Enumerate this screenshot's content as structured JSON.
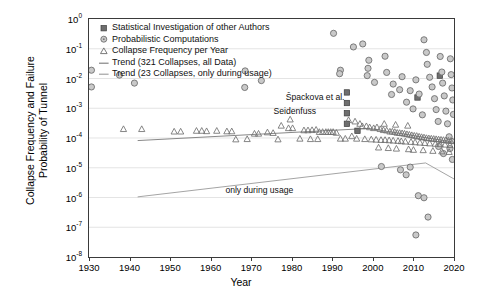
{
  "chart_data": {
    "type": "scatter",
    "title": "",
    "xlabel": "Year",
    "ylabel": "Collapse Frequency and Failure Probability of Tunnel",
    "ylabel_line1": "Collapse Frequency and Failure",
    "ylabel_line2": "Probability of Tunnel",
    "xlim": [
      1930,
      2020
    ],
    "ylim": [
      1e-08,
      1
    ],
    "yscale": "log",
    "xticks": [
      1930,
      1940,
      1950,
      1960,
      1970,
      1980,
      1990,
      2000,
      2010,
      2020
    ],
    "xtick_labels": [
      "1930",
      "1940",
      "1950",
      "1960",
      "1970",
      "1980",
      "1990",
      "2000",
      "2010",
      "2020"
    ],
    "yticks": [
      1,
      0.1,
      0.01,
      0.001,
      0.0001,
      1e-05,
      1e-06,
      1e-07,
      1e-08
    ],
    "ytick_labels": [
      "10⁰",
      "10⁻¹",
      "10⁻²",
      "10⁻³",
      "10⁻⁴",
      "10⁻⁵",
      "10⁻⁶",
      "10⁻⁷",
      "10⁻⁸"
    ],
    "ytick_mantissa": [
      "10",
      "10",
      "10",
      "10",
      "10",
      "10",
      "10",
      "10",
      "10"
    ],
    "ytick_exponents": [
      "0",
      "-1",
      "-2",
      "-3",
      "-4",
      "-5",
      "-6",
      "-7",
      "-8"
    ],
    "grid": true,
    "grid_color": "#d8d8d8",
    "legend_position": "upper-left",
    "legend": [
      {
        "label": "Statistical Investigation of other Authors",
        "marker": "square",
        "color": "#8c8c8c"
      },
      {
        "label": "Probabilistic Computations",
        "marker": "circle",
        "color": "#8c8c8c"
      },
      {
        "label": "Collapse Frequency per Year",
        "marker": "triangle",
        "color": "#6b6b6b"
      },
      {
        "label": "Trend (321 Collapses, all Data)",
        "marker": "line",
        "color": "#7a7a7a"
      },
      {
        "label": "Trend (23 Collapses, only during usage)",
        "marker": "line",
        "color": "#9a9a9a"
      }
    ],
    "annotations": [
      {
        "text": "Špackova et al.",
        "x": 1993.0,
        "y": 0.0022,
        "align": "right"
      },
      {
        "text": "Seidenfuss",
        "x": 1986.0,
        "y": 0.00075,
        "align": "right"
      },
      {
        "text": "only during usage",
        "x": 1972.0,
        "y": 1.6e-06,
        "align": "center"
      }
    ],
    "series": [
      {
        "name": "Statistical Investigation of other Authors",
        "marker": "square",
        "color": "#6e6e6e",
        "points": [
          [
            1993.6,
            0.0034
          ],
          [
            1993.6,
            0.0015
          ],
          [
            1993.6,
            0.00068
          ],
          [
            1993.6,
            0.0003
          ],
          [
            1996.2,
            0.000175
          ],
          [
            2011.0,
            0.0023
          ],
          [
            2016.5,
            0.0125
          ]
        ]
      },
      {
        "name": "Probabilistic Computations",
        "marker": "circle",
        "color": "#9a9a9a",
        "points": [
          [
            1930.6,
            0.019
          ],
          [
            1930.6,
            0.0052
          ],
          [
            1937.5,
            0.013
          ],
          [
            1941.2,
            0.007
          ],
          [
            1968.5,
            0.018
          ],
          [
            1972.5,
            0.0085
          ],
          [
            1968.4,
            0.005
          ],
          [
            1990.3,
            0.33
          ],
          [
            1995.2,
            0.115
          ],
          [
            1992.0,
            0.019
          ],
          [
            1991.8,
            0.0145
          ],
          [
            1997.5,
            0.145
          ],
          [
            1999.0,
            0.041
          ],
          [
            1998.8,
            0.022
          ],
          [
            1998.6,
            0.0125
          ],
          [
            2000.4,
            0.0074
          ],
          [
            2003.0,
            0.056
          ],
          [
            2003.4,
            0.016
          ],
          [
            2005.0,
            0.0065
          ],
          [
            2004.6,
            0.0029
          ],
          [
            2007.2,
            0.0115
          ],
          [
            2006.6,
            0.0042
          ],
          [
            2008.3,
            0.0016
          ],
          [
            2009.2,
            0.0039
          ],
          [
            2009.9,
            0.00095
          ],
          [
            2010.6,
            0.009
          ],
          [
            2011.4,
            0.003
          ],
          [
            2012.2,
            0.0006
          ],
          [
            2012.6,
            0.2
          ],
          [
            2013.2,
            0.075
          ],
          [
            2013.4,
            0.03
          ],
          [
            2014.0,
            0.011
          ],
          [
            2014.6,
            0.0052
          ],
          [
            2015.2,
            0.0021
          ],
          [
            2015.6,
            0.0009
          ],
          [
            2016.1,
            0.00036
          ],
          [
            2016.6,
            0.055
          ],
          [
            2017.0,
            0.0165
          ],
          [
            2017.2,
            0.007
          ],
          [
            2017.6,
            0.0026
          ],
          [
            2018.0,
            0.0008
          ],
          [
            2018.4,
            0.0003
          ],
          [
            2018.8,
            0.00011
          ],
          [
            2019.1,
            0.046
          ],
          [
            2019.3,
            0.0135
          ],
          [
            2019.5,
            0.0048
          ],
          [
            2019.7,
            0.0019
          ],
          [
            2019.85,
            0.00062
          ],
          [
            2002.1,
            1.1e-05
          ],
          [
            2006.8,
            8.5e-06
          ],
          [
            2008.2,
            5.8e-06
          ],
          [
            2009.2,
            1.05e-05
          ],
          [
            2011.2,
            1.15e-06
          ],
          [
            2012.6,
            9.8e-07
          ],
          [
            2013.6,
            2.2e-07
          ],
          [
            2010.6,
            5.5e-08
          ],
          [
            2011.0,
            1.2e-09
          ],
          [
            2016.2,
            5.2e-05
          ],
          [
            2017.4,
            3e-05
          ],
          [
            2019.0,
            4.4e-05
          ],
          [
            2019.6,
            1.9e-05
          ]
        ]
      },
      {
        "name": "Collapse Frequency per Year",
        "marker": "triangle",
        "color": "#707070",
        "points": [
          [
            1938.5,
            0.0002
          ],
          [
            1943.0,
            0.0002
          ],
          [
            1951.0,
            0.000165
          ],
          [
            1952.6,
            0.000165
          ],
          [
            1956.5,
            0.000175
          ],
          [
            1957.8,
            0.000175
          ],
          [
            1959.0,
            0.00017
          ],
          [
            1961.5,
            0.000175
          ],
          [
            1964.0,
            0.000168
          ],
          [
            1965.2,
            0.000168
          ],
          [
            1970.8,
            0.00014
          ],
          [
            1971.8,
            0.00014
          ],
          [
            1974.0,
            0.000155
          ],
          [
            1975.4,
            0.000148
          ],
          [
            1977.4,
            0.00026
          ],
          [
            1979.2,
            0.000215
          ],
          [
            1980.2,
            0.000215
          ],
          [
            1979.6,
            0.00042
          ],
          [
            1983.0,
            0.000182
          ],
          [
            1984.0,
            0.000182
          ],
          [
            1985.0,
            0.000185
          ],
          [
            1986.0,
            0.00019
          ],
          [
            1986.8,
            0.00016
          ],
          [
            1987.6,
            0.00016
          ],
          [
            1988.4,
            0.00016
          ],
          [
            1989.0,
            0.00016
          ],
          [
            1989.6,
            0.00016
          ],
          [
            1990.2,
            0.00016
          ],
          [
            1991.0,
            0.00015
          ],
          [
            1992.0,
            9.5e-05
          ],
          [
            1993.2,
            9.5e-05
          ],
          [
            1994.8,
            0.000115
          ],
          [
            1996.0,
            9.5e-05
          ],
          [
            1982.0,
            9.5e-05
          ],
          [
            1984.6,
            9.2e-05
          ],
          [
            1986.4,
            9.2e-05
          ],
          [
            1976.6,
            9e-05
          ],
          [
            1969.0,
            9.2e-05
          ],
          [
            1966.2,
            9e-05
          ],
          [
            1997.4,
            0.00025
          ],
          [
            1998.4,
            0.00025
          ],
          [
            1999.2,
            0.00023
          ],
          [
            2000.2,
            0.000215
          ],
          [
            2001.0,
            0.00023
          ],
          [
            2001.8,
            0.0002
          ],
          [
            2002.6,
            0.000185
          ],
          [
            2003.4,
            0.00018
          ],
          [
            2004.2,
            0.000165
          ],
          [
            2004.8,
            0.000165
          ],
          [
            2005.4,
            0.00016
          ],
          [
            2006.0,
            0.00015
          ],
          [
            2006.6,
            0.000148
          ],
          [
            2007.2,
            0.000145
          ],
          [
            2007.8,
            0.00014
          ],
          [
            2008.4,
            0.000135
          ],
          [
            2009.0,
            0.00013
          ],
          [
            2009.6,
            0.000125
          ],
          [
            2010.2,
            0.00012
          ],
          [
            2010.8,
            0.000118
          ],
          [
            2011.4,
            0.000112
          ],
          [
            2012.0,
            0.000108
          ],
          [
            2012.6,
            0.000105
          ],
          [
            2013.2,
            0.0001
          ],
          [
            2013.8,
            9.8e-05
          ],
          [
            2014.4,
            9.6e-05
          ],
          [
            2015.0,
            9.4e-05
          ],
          [
            2015.6,
            9.2e-05
          ],
          [
            2016.2,
            9e-05
          ],
          [
            2016.8,
            8.8e-05
          ],
          [
            2017.4,
            8.6e-05
          ],
          [
            2018.0,
            8.4e-05
          ],
          [
            2018.6,
            8.2e-05
          ],
          [
            2019.2,
            8e-05
          ],
          [
            2019.7,
            7.8e-05
          ],
          [
            1998.0,
            9.2e-05
          ],
          [
            1999.6,
            9e-05
          ],
          [
            2000.8,
            8.8e-05
          ],
          [
            2002.0,
            8.6e-05
          ],
          [
            2003.0,
            8.6e-05
          ],
          [
            2004.0,
            8.4e-05
          ],
          [
            2005.0,
            8.2e-05
          ],
          [
            2006.2,
            8e-05
          ],
          [
            2007.0,
            7.8e-05
          ],
          [
            2008.0,
            7.6e-05
          ],
          [
            2009.4,
            7.4e-05
          ],
          [
            2010.4,
            7.2e-05
          ],
          [
            2011.6,
            7e-05
          ],
          [
            2012.8,
            6.8e-05
          ],
          [
            2014.0,
            6.6e-05
          ],
          [
            2015.4,
            6.4e-05
          ],
          [
            2016.6,
            6.2e-05
          ],
          [
            2017.8,
            6e-05
          ],
          [
            2019.0,
            5.8e-05
          ],
          [
            2001.4,
            4.8e-05
          ],
          [
            2003.8,
            4.6e-05
          ],
          [
            2005.8,
            4.4e-05
          ],
          [
            2008.8,
            4.2e-05
          ],
          [
            2010.0,
            4e-05
          ],
          [
            2012.4,
            3.9e-05
          ],
          [
            2014.8,
            3.7e-05
          ],
          [
            2017.0,
            3.55e-05
          ],
          [
            2018.8,
            3.4e-05
          ],
          [
            1994.0,
            0.0004
          ],
          [
            1995.6,
            0.00036
          ],
          [
            1996.8,
            0.0003
          ],
          [
            2002.8,
            0.0003
          ],
          [
            2005.6,
            0.00028
          ],
          [
            2008.6,
            0.00026
          ]
        ]
      }
    ],
    "trend_lines": [
      {
        "name": "Trend (321 Collapses, all Data)",
        "color": "#7a7a7a",
        "start": [
          1942.0,
          8.2e-05
        ],
        "end": [
          2020.0,
          7.2e-05
        ],
        "peak": [
          1999.0,
          0.00021
        ]
      },
      {
        "name": "Trend (23 Collapses, only during usage)",
        "color": "#9a9a9a",
        "start": [
          1942.0,
          1.05e-06
        ],
        "end": [
          2020.0,
          4.2e-06
        ],
        "peak": [
          2013.0,
          1.45e-05
        ]
      }
    ]
  }
}
